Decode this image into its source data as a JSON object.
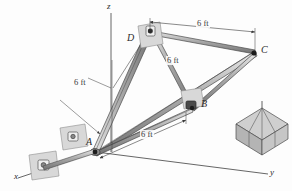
{
  "figure": {
    "type": "engineering-statics-3d-diagram",
    "background_color": "#fdfdfd",
    "line_color": "#3a3a3a",
    "member_fill": "#b8b8b8",
    "bracket_fill": "#d4d4d4",
    "crate_fill": "#c6c6c6"
  },
  "axes": [
    {
      "name": "x-axis",
      "label": "x"
    },
    {
      "name": "y-axis",
      "label": "y"
    },
    {
      "name": "z-axis",
      "label": "z"
    }
  ],
  "points": [
    {
      "name": "point-a",
      "label": "A"
    },
    {
      "name": "point-b",
      "label": "B"
    },
    {
      "name": "point-c",
      "label": "C"
    },
    {
      "name": "point-d",
      "label": "D"
    }
  ],
  "dimensions": [
    {
      "name": "dim-z-height",
      "label": "6 ft"
    },
    {
      "name": "dim-d-to-c",
      "label": "6 ft"
    },
    {
      "name": "dim-d-diagonal",
      "label": "6 ft"
    },
    {
      "name": "dim-a-to-b",
      "label": "6 ft"
    }
  ]
}
